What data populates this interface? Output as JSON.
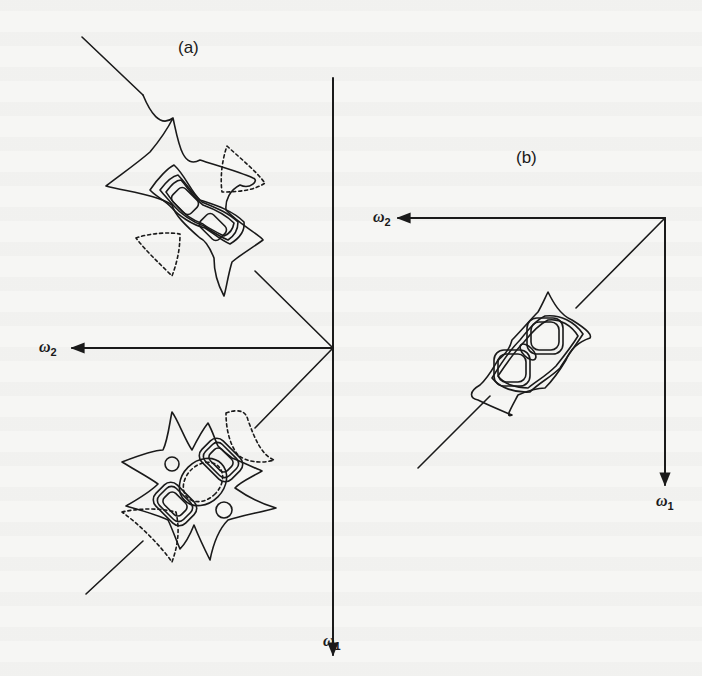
{
  "figure": {
    "panels": [
      {
        "id": "a",
        "label": "(a)",
        "axes": {
          "horizontal": "ω2",
          "vertical": "ω1"
        },
        "description": "Frequency-domain contour plot with two separated lobes along the diagonal; solid lines positive contours, dashed lines negative contours"
      },
      {
        "id": "b",
        "label": "(b)",
        "axes": {
          "horizontal": "ω2",
          "vertical": "ω1"
        },
        "description": "Frequency-domain contour plot with a single compact lobe pair along the diagonal"
      }
    ],
    "labels": {
      "a_title": "(a)",
      "b_title": "(b)",
      "a_w2_base": "ω",
      "a_w2_sub": "2",
      "a_w1_base": "ω",
      "a_w1_sub": "1",
      "b_w2_base": "ω",
      "b_w2_sub": "2",
      "b_w1_base": "ω",
      "b_w1_sub": "1"
    },
    "colors": {
      "ink": "#1a1a1a",
      "paper": "#f6f6f4"
    }
  }
}
